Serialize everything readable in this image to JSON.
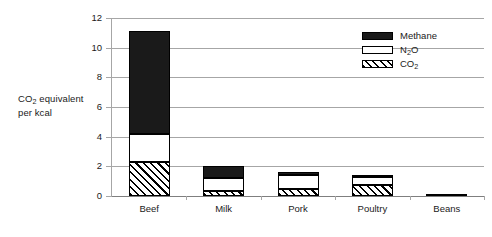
{
  "chart_data": {
    "type": "bar",
    "stacked": true,
    "title": "",
    "xlabel": "",
    "ylabel_line1": "CO",
    "ylabel_sub1": "2",
    "ylabel_line1_rest": " equivalent",
    "ylabel_line2": "per kcal",
    "categories": [
      "Beef",
      "Milk",
      "Pork",
      "Poultry",
      "Beans"
    ],
    "series": [
      {
        "name": "CO2",
        "legend": "CO",
        "legend_sub": "2",
        "values": [
          2.3,
          0.35,
          0.45,
          0.75,
          0.15
        ]
      },
      {
        "name": "N2O",
        "legend": "N",
        "legend_sub": "2",
        "legend_rest": "O",
        "values": [
          1.9,
          0.85,
          1.0,
          0.5,
          0.0
        ]
      },
      {
        "name": "Methane",
        "legend": "Methane",
        "values": [
          6.95,
          0.8,
          0.2,
          0.2,
          0.0
        ]
      }
    ],
    "totals": [
      11.15,
      2.0,
      1.65,
      1.45,
      0.15
    ],
    "ylim": [
      0,
      12
    ],
    "yticks": [
      0,
      2,
      4,
      6,
      8,
      10,
      12
    ],
    "ytick_labels": [
      "0",
      "2",
      "4",
      "6",
      "8",
      "10",
      "12"
    ],
    "grid": true,
    "legend_position": "top-right",
    "colors": {
      "methane": "#1a1a1a",
      "n2o": "#ffffff",
      "co2_hatch": "#000000",
      "gridline": "#a6a6a6",
      "axis": "#7f7f7f",
      "text": "#1a1a1a",
      "background": "#ffffff"
    }
  },
  "legend": {
    "items": [
      {
        "label": "Methane",
        "sub": "",
        "rest": ""
      },
      {
        "label": "N",
        "sub": "2",
        "rest": "O"
      },
      {
        "label": "CO",
        "sub": "2",
        "rest": ""
      }
    ]
  }
}
